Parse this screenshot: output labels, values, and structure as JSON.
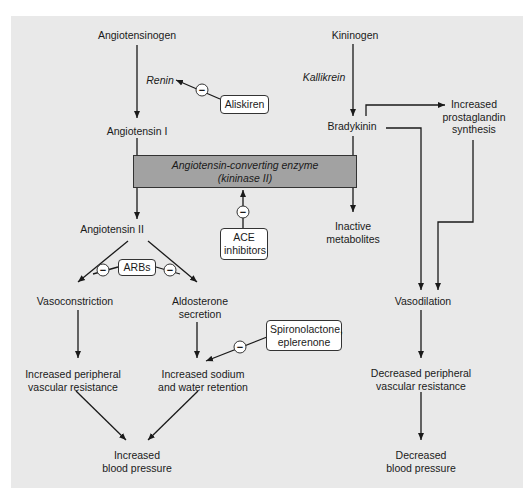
{
  "diagram": {
    "nodes": {
      "angiotensinogen": "Angiotensinogen",
      "renin": "Renin",
      "angiotensin_i": "Angiotensin I",
      "angiotensin_ii": "Angiotensin II",
      "vasoconstriction": "Vasoconstriction",
      "aldosterone_1": "Aldosterone",
      "aldosterone_2": "secretion",
      "inc_pvr_1": "Increased peripheral",
      "inc_pvr_2": "vascular resistance",
      "inc_na_1": "Increased sodium",
      "inc_na_2": "and water retention",
      "inc_bp_1": "Increased",
      "inc_bp_2": "blood pressure",
      "kininogen": "Kininogen",
      "kallikrein": "Kallikrein",
      "bradykinin": "Bradykinin",
      "prosta_1": "Increased",
      "prosta_2": "prostaglandin",
      "prosta_3": "synthesis",
      "inactive_1": "Inactive",
      "inactive_2": "metabolites",
      "vasodilation": "Vasodilation",
      "dec_pvr_1": "Decreased peripheral",
      "dec_pvr_2": "vascular resistance",
      "dec_bp_1": "Decreased",
      "dec_bp_2": "blood pressure"
    },
    "enzyme": {
      "line1": "Angiotensin-converting enzyme",
      "line2": "(kininase II)"
    },
    "drugs": {
      "aliskiren": "Aliskiren",
      "ace_1": "ACE",
      "ace_2": "inhibitors",
      "arbs": "ARBs",
      "spiro_1": "Spironolactone,",
      "spiro_2": "eplerenone"
    },
    "inhibit_symbol": "−",
    "colors": {
      "panel": "#e9e9e9",
      "enzyme_box": "#a2a2a2",
      "line": "#1a1a1a",
      "drug_box": "#ffffff"
    }
  }
}
